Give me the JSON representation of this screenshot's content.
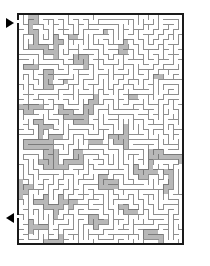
{
  "page": {
    "background_color": "#ffffff"
  },
  "maze": {
    "name": "rectangular-maze",
    "origin_x": 18,
    "origin_y": 14,
    "cols": 33,
    "rows": 46,
    "cell": 5,
    "wall_thickness": 1,
    "border_thickness": 2,
    "border_color": "#1a1a1a",
    "wall_color": "#8f8f8f",
    "passage_color": "#ffffff",
    "shaded_region_color": "#b8b8b8",
    "shaded_region_wall_color": "#7a7a7a",
    "seed": 20240517
  },
  "entrance": {
    "label": "entrance-arrow",
    "glyph": "▶",
    "side": "left",
    "row": 1,
    "color": "#000000"
  },
  "exit": {
    "label": "exit-arrow",
    "glyph": "◀",
    "side": "left",
    "row": 40,
    "color": "#000000"
  }
}
